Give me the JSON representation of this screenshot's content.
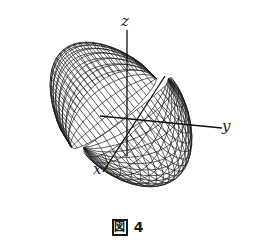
{
  "figure": {
    "type": "3d-wireframe-surface",
    "surface": "spindle torus (surface of revolution touching its axis at two points)",
    "axes": {
      "x_label": "x",
      "y_label": "y",
      "z_label": "z"
    },
    "caption": {
      "prefix": "図",
      "number": "4"
    },
    "colors": {
      "line": "#1a1a1a",
      "background": "#ffffff"
    },
    "projection": {
      "center": [
        120,
        113
      ],
      "pinch_top": [
        163,
        79
      ],
      "pinch_bottom": [
        78,
        148
      ],
      "R": 0.55,
      "r": 1.0,
      "scale": 62,
      "u_steps": 40,
      "v_steps": 24
    }
  }
}
